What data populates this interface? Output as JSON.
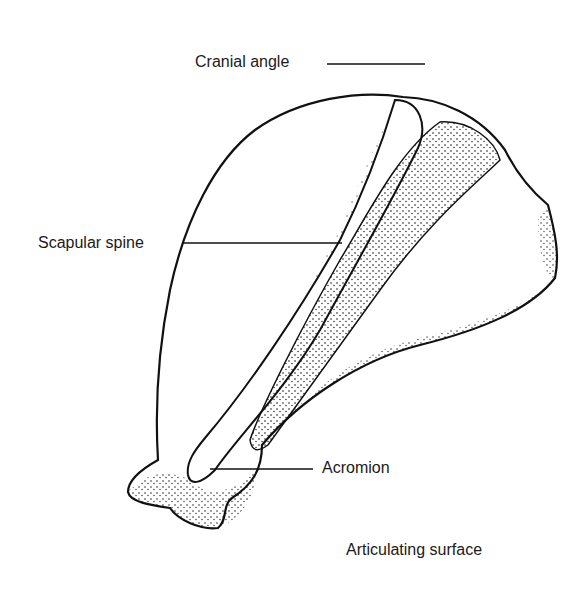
{
  "figure": {
    "ink_color": "#111111",
    "background_color": "#ffffff",
    "labels": [
      {
        "id": "cranial-angle",
        "text": "Cranial angle"
      },
      {
        "id": "scapular-spine",
        "text": "Scapular spine"
      },
      {
        "id": "acromion",
        "text": "Acromion"
      },
      {
        "id": "articulating-surface",
        "text": "Articulating surface"
      }
    ]
  }
}
